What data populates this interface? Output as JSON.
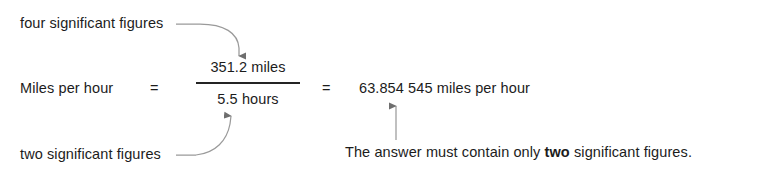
{
  "document": {
    "type": "worked-example-significant-figures",
    "annotations": {
      "top_label": "four significant figures",
      "bottom_label": "two significant figures"
    },
    "equation": {
      "left_side": "Miles per hour",
      "equals_1": "=",
      "numerator": "351.2 miles",
      "denominator": "5.5 hours",
      "equals_2": "=",
      "result": "63.854 545 miles per hour"
    },
    "note": {
      "prefix": "The answer must contain only ",
      "emphasis": "two",
      "suffix": " significant figures."
    },
    "colors": {
      "text": "#1c1c1c",
      "rule": "#242424",
      "arrow": "#6e6e6e",
      "background": "#ffffff"
    }
  }
}
